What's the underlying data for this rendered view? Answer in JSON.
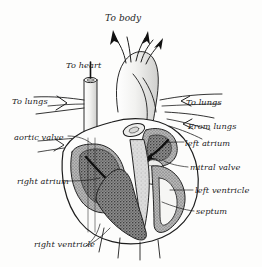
{
  "figure": {
    "style": "engraving",
    "background_color": "#fdfdfc",
    "ink_color": "#1c1c1c"
  },
  "labels": {
    "to_body": "To body",
    "to_heart": "To heart",
    "to_lungs_left": "To lungs",
    "aortic_valve": "aortic valve",
    "right_atrium": "right atrium",
    "right_ventricle": "right ventricle",
    "to_lungs_right": "To lungs",
    "from_lungs": "From lungs",
    "left_atrium": "left atrium",
    "mitral_valve": "mitral valve",
    "left_ventricle": "left ventricle",
    "septum": "septum"
  }
}
